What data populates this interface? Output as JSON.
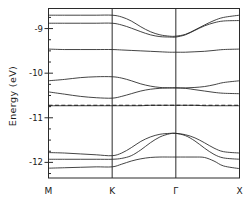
{
  "chart_data": {
    "type": "line",
    "title": "",
    "subtitle": "",
    "xlabel": "",
    "ylabel": "Energy  (eV)",
    "ylim": [
      -12.35,
      -8.55
    ],
    "xlim": [
      0,
      3
    ],
    "grid": false,
    "legend": null,
    "xtick_labels": [
      "M",
      "K",
      "Γ",
      "X"
    ],
    "xtick_values": [
      0,
      1,
      2,
      3
    ],
    "ytick_labels": [
      "-9",
      "-10",
      "-11",
      "-12"
    ],
    "ytick_values": [
      -9,
      -10,
      -11,
      -12
    ],
    "y_minor_ticks": [
      -8.75,
      -9.25,
      -9.5,
      -9.75,
      -10.25,
      -10.5,
      -10.75,
      -11.25,
      -11.5,
      -11.75,
      -12.25
    ],
    "high_symmetry_lines": [
      1,
      2
    ],
    "fermi_level": -10.72,
    "fermi_style": "dashed",
    "x": [
      0,
      0.25,
      0.5,
      0.75,
      1,
      1.15,
      1.3,
      1.45,
      1.6,
      1.75,
      1.9,
      2,
      2.15,
      2.3,
      2.45,
      2.6,
      2.75,
      3
    ],
    "series": [
      {
        "name": "band-1",
        "values": [
          -8.7,
          -8.7,
          -8.7,
          -8.7,
          -8.7,
          -8.74,
          -8.83,
          -8.96,
          -9.07,
          -9.14,
          -9.17,
          -9.17,
          -9.13,
          -9.03,
          -8.92,
          -8.82,
          -8.75,
          -8.7
        ]
      },
      {
        "name": "band-2",
        "values": [
          -8.88,
          -8.88,
          -8.88,
          -8.88,
          -8.88,
          -8.92,
          -8.99,
          -9.07,
          -9.14,
          -9.18,
          -9.19,
          -9.19,
          -9.14,
          -9.04,
          -8.94,
          -8.87,
          -8.83,
          -8.82
        ]
      },
      {
        "name": "band-3",
        "values": [
          -9.46,
          -9.47,
          -9.47,
          -9.47,
          -9.47,
          -9.48,
          -9.49,
          -9.5,
          -9.51,
          -9.52,
          -9.53,
          -9.53,
          -9.53,
          -9.52,
          -9.51,
          -9.49,
          -9.47,
          -9.46
        ]
      },
      {
        "name": "band-4",
        "values": [
          -10.17,
          -10.14,
          -10.1,
          -10.08,
          -10.08,
          -10.11,
          -10.17,
          -10.24,
          -10.29,
          -10.32,
          -10.33,
          -10.33,
          -10.33,
          -10.32,
          -10.3,
          -10.26,
          -10.21,
          -10.17
        ]
      },
      {
        "name": "band-5",
        "values": [
          -10.42,
          -10.47,
          -10.52,
          -10.55,
          -10.56,
          -10.52,
          -10.46,
          -10.4,
          -10.36,
          -10.34,
          -10.33,
          -10.33,
          -10.34,
          -10.37,
          -10.4,
          -10.43,
          -10.45,
          -10.46
        ]
      },
      {
        "name": "band-6",
        "values": [
          -10.73,
          -10.73,
          -10.73,
          -10.73,
          -10.73,
          -10.73,
          -10.73,
          -10.73,
          -10.72,
          -10.72,
          -10.72,
          -10.72,
          -10.72,
          -10.72,
          -10.73,
          -10.73,
          -10.73,
          -10.73
        ]
      },
      {
        "name": "band-7",
        "values": [
          -11.78,
          -11.79,
          -11.81,
          -11.83,
          -11.85,
          -11.79,
          -11.67,
          -11.53,
          -11.43,
          -11.37,
          -11.35,
          -11.35,
          -11.38,
          -11.45,
          -11.56,
          -11.68,
          -11.76,
          -11.79
        ]
      },
      {
        "name": "band-8",
        "values": [
          -11.93,
          -11.93,
          -11.93,
          -11.93,
          -11.93,
          -11.91,
          -11.85,
          -11.72,
          -11.56,
          -11.43,
          -11.36,
          -11.35,
          -11.4,
          -11.52,
          -11.68,
          -11.82,
          -11.9,
          -11.93
        ]
      },
      {
        "name": "band-9",
        "values": [
          -12.13,
          -12.12,
          -12.11,
          -12.1,
          -12.1,
          -12.04,
          -11.97,
          -11.92,
          -11.89,
          -11.88,
          -11.88,
          -11.88,
          -11.88,
          -11.88,
          -11.89,
          -11.97,
          -12.08,
          -12.14
        ]
      }
    ]
  },
  "axes": {
    "y_axis_title": "Energy  (eV)",
    "x_axis_title": ""
  }
}
